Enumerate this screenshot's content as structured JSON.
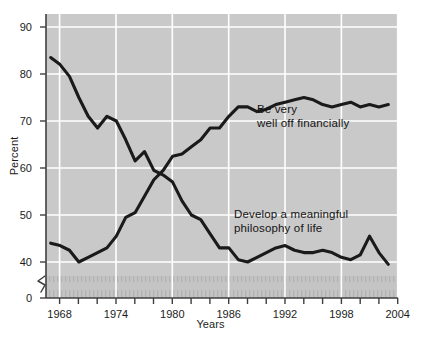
{
  "chart_data": {
    "type": "line",
    "title": "",
    "xlabel": "Years",
    "ylabel": "Percent",
    "xlim": [
      1966.5,
      2004
    ],
    "ylim": [
      36,
      93
    ],
    "grid": true,
    "y_axis_break": true,
    "y_axis_break_value": 0,
    "legend_position": "inline-annotations",
    "y_ticks": [
      0,
      40,
      50,
      60,
      70,
      80,
      90
    ],
    "y_tick_labels": [
      "0",
      "40",
      "50",
      "60",
      "70",
      "80",
      "90"
    ],
    "x_ticks": [
      1968,
      1970,
      1972,
      1974,
      1976,
      1978,
      1980,
      1982,
      1984,
      1986,
      1988,
      1990,
      1992,
      1994,
      1996,
      1998,
      2000,
      2002,
      2004
    ],
    "x_tick_labels_shown": [
      "1968",
      "1974",
      "1980",
      "1986",
      "1992",
      "1998",
      "2004"
    ],
    "x": [
      1967,
      1968,
      1969,
      1970,
      1971,
      1972,
      1973,
      1974,
      1975,
      1976,
      1977,
      1978,
      1979,
      1980,
      1981,
      1982,
      1983,
      1984,
      1985,
      1986,
      1987,
      1988,
      1989,
      1990,
      1991,
      1992,
      1993,
      1994,
      1995,
      1996,
      1997,
      1998,
      1999,
      2000,
      2001,
      2002,
      2003
    ],
    "series": [
      {
        "name": "Develop a meaningful philosophy of life",
        "annotation": "Develop a meaningful\nphilosophy of life",
        "color": "#1a1a1a",
        "values": [
          83.5,
          82.0,
          79.5,
          75.0,
          71.0,
          68.5,
          71.0,
          70.0,
          66.0,
          61.5,
          63.5,
          59.5,
          58.5,
          57.0,
          53.0,
          50.0,
          49.0,
          46.0,
          43.0,
          43.0,
          40.5,
          40.0,
          41.0,
          42.0,
          43.0,
          43.5,
          42.5,
          42.0,
          42.0,
          42.5,
          42.0,
          41.0,
          40.5,
          41.5,
          45.5,
          42.0,
          39.5
        ]
      },
      {
        "name": "Be very well off financially",
        "annotation": "Be very\nwell off financially",
        "color": "#1a1a1a",
        "values": [
          44.0,
          43.5,
          42.5,
          40.0,
          41.0,
          42.0,
          43.0,
          45.5,
          49.5,
          50.5,
          54.0,
          57.5,
          59.5,
          62.5,
          63.0,
          64.5,
          66.0,
          68.5,
          68.5,
          71.0,
          73.0,
          73.0,
          72.0,
          72.5,
          73.5,
          74.0,
          74.5,
          75.0,
          74.5,
          73.5,
          73.0,
          73.5,
          74.0,
          73.0,
          73.5,
          73.0,
          73.5
        ]
      }
    ]
  },
  "chart": {
    "background_plot_color": "#c9c9c9",
    "gridline_color": "#ffffff",
    "line_color": "#1a1a1a",
    "axis_color": "#4a4a4a"
  }
}
